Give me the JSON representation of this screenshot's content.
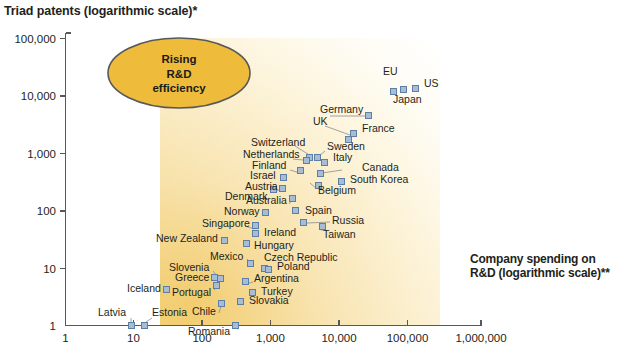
{
  "chart_data": {
    "type": "scatter",
    "title": "",
    "ylabel": "Triad patents (logarithmic scale)*",
    "xlabel": "Company spending on R&D (logarithmic scale)**",
    "xscale": "log",
    "yscale": "log",
    "xlim": [
      1,
      1000000
    ],
    "ylim": [
      1,
      100000
    ],
    "grid": false,
    "legend": "none",
    "x_ticks": [
      "1",
      "10",
      "100",
      "1,000",
      "10,000",
      "100,000",
      "1,000,000"
    ],
    "x_tick_values": [
      1,
      10,
      100,
      1000,
      10000,
      100000,
      1000000
    ],
    "y_ticks": [
      "1",
      "10",
      "100",
      "1,000",
      "10,000",
      "100,000"
    ],
    "y_tick_values": [
      1,
      10,
      100,
      1000,
      10000,
      100000
    ],
    "annotations": [
      {
        "name": "rising-rd-efficiency-callout",
        "lines": [
          "Rising",
          "R&D",
          "efficiency"
        ],
        "shape": "ellipse",
        "fill": "#EFBB3A",
        "stroke": "#58585b"
      }
    ],
    "background_gradient": {
      "description": "pale yellow wedge fading to white toward upper right",
      "from": "#f7d98a",
      "to": "#ffffff"
    },
    "marker_style": {
      "shape": "square",
      "fill": "#a8bdd4",
      "stroke": "#5d7fa6"
    },
    "points": [
      {
        "label": "US",
        "x": 415,
        "y": 88,
        "lx": 424,
        "ly": 83,
        "anchor": "left"
      },
      {
        "label": "EU",
        "x": 403,
        "y": 89,
        "lx": 391,
        "ly": 71,
        "anchor": "left"
      },
      {
        "label": "Japan",
        "x": 393,
        "y": 91,
        "lx": 393,
        "ly": 99,
        "anchor": "left"
      },
      {
        "label": "Germany",
        "x": 368,
        "y": 115,
        "lx": 322,
        "ly": 109,
        "anchor": "left"
      },
      {
        "label": "France",
        "x": 353,
        "y": 133,
        "lx": 362,
        "ly": 128,
        "anchor": "left"
      },
      {
        "label": "UK",
        "x": 348,
        "y": 139,
        "lx": 313,
        "ly": 121,
        "anchor": "left"
      },
      {
        "label": "Switzerland",
        "x": 309,
        "y": 157,
        "lx": 251,
        "ly": 142,
        "anchor": "left"
      },
      {
        "label": "Sweden",
        "x": 317,
        "y": 157,
        "lx": 327,
        "ly": 146,
        "anchor": "left"
      },
      {
        "label": "Netherlands",
        "x": 306,
        "y": 160,
        "lx": 243,
        "ly": 154,
        "anchor": "left"
      },
      {
        "label": "Italy",
        "x": 324,
        "y": 162,
        "lx": 333,
        "ly": 157,
        "anchor": "left"
      },
      {
        "label": "Finland",
        "x": 300,
        "y": 170,
        "lx": 252,
        "ly": 165,
        "anchor": "left"
      },
      {
        "label": "Canada",
        "x": 320,
        "y": 173,
        "lx": 362,
        "ly": 167,
        "anchor": "left"
      },
      {
        "label": "Israel",
        "x": 283,
        "y": 177,
        "lx": 250,
        "ly": 175,
        "anchor": "left"
      },
      {
        "label": "South Korea",
        "x": 341,
        "y": 181,
        "lx": 350,
        "ly": 179,
        "anchor": "left"
      },
      {
        "label": "Austria",
        "x": 282,
        "y": 188,
        "lx": 245,
        "ly": 186,
        "anchor": "left"
      },
      {
        "label": "Belgium",
        "x": 318,
        "y": 185,
        "lx": 318,
        "ly": 190,
        "anchor": "left"
      },
      {
        "label": "Denmark",
        "x": 273,
        "y": 189,
        "lx": 237,
        "ly": 196,
        "anchor": "left"
      },
      {
        "label": "Australia",
        "x": 292,
        "y": 198,
        "lx": 290,
        "ly": 200,
        "anchor": "left"
      },
      {
        "label": "Norway",
        "x": 265,
        "y": 212,
        "lx": 224,
        "ly": 211,
        "anchor": "left"
      },
      {
        "label": "Spain",
        "x": 295,
        "y": 210,
        "lx": 305,
        "ly": 210,
        "anchor": "left"
      },
      {
        "label": "Singapore",
        "x": 255,
        "y": 225,
        "lx": 206,
        "ly": 223,
        "anchor": "left"
      },
      {
        "label": "Russia",
        "x": 303,
        "y": 222,
        "lx": 332,
        "ly": 220,
        "anchor": "left"
      },
      {
        "label": "Ireland",
        "x": 255,
        "y": 233,
        "lx": 264,
        "ly": 232,
        "anchor": "left"
      },
      {
        "label": "Taiwan",
        "x": 322,
        "y": 226,
        "lx": 323,
        "ly": 234,
        "anchor": "left"
      },
      {
        "label": "New Zealand",
        "x": 224,
        "y": 240,
        "lx": 156,
        "ly": 238,
        "anchor": "left"
      },
      {
        "label": "Hungary",
        "x": 246,
        "y": 243,
        "lx": 254,
        "ly": 245,
        "anchor": "left"
      },
      {
        "label": "Mexico",
        "x": 250,
        "y": 263,
        "lx": 210,
        "ly": 256,
        "anchor": "left"
      },
      {
        "label": "Czech Republic",
        "x": 264,
        "y": 268,
        "lx": 264,
        "ly": 257,
        "anchor": "left"
      },
      {
        "label": "Slovenia",
        "x": 214,
        "y": 277,
        "lx": 182,
        "ly": 267,
        "anchor": "left"
      },
      {
        "label": "Poland",
        "x": 268,
        "y": 269,
        "lx": 277,
        "ly": 266,
        "anchor": "left"
      },
      {
        "label": "Greece",
        "x": 220,
        "y": 278,
        "lx": 175,
        "ly": 277,
        "anchor": "left"
      },
      {
        "label": "Argentina",
        "x": 245,
        "y": 281,
        "lx": 254,
        "ly": 278,
        "anchor": "left"
      },
      {
        "label": "Iceland",
        "x": 166,
        "y": 289,
        "lx": 130,
        "ly": 288,
        "anchor": "left"
      },
      {
        "label": "Portugal",
        "x": 216,
        "y": 285,
        "lx": 188,
        "ly": 292,
        "anchor": "left"
      },
      {
        "label": "Turkey",
        "x": 252,
        "y": 292,
        "lx": 261,
        "ly": 291,
        "anchor": "left"
      },
      {
        "label": "Chile",
        "x": 221,
        "y": 303,
        "lx": 206,
        "ly": 311,
        "anchor": "left"
      },
      {
        "label": "Slovakia",
        "x": 240,
        "y": 301,
        "lx": 249,
        "ly": 300,
        "anchor": "left"
      },
      {
        "label": "Latvia",
        "x": 131,
        "y": 325,
        "lx": 110,
        "ly": 312,
        "anchor": "left"
      },
      {
        "label": "Estonia",
        "x": 144,
        "y": 325,
        "lx": 152,
        "ly": 312,
        "anchor": "left"
      },
      {
        "label": "Romania",
        "x": 235,
        "y": 325,
        "lx": 216,
        "ly": 331,
        "anchor": "left"
      }
    ],
    "leader_lines": [
      {
        "from": [
          330,
          116
        ],
        "to": [
          366,
          116
        ]
      },
      {
        "from": [
          325,
          126
        ],
        "to": [
          350,
          135
        ]
      },
      {
        "from": [
          295,
          146
        ],
        "to": [
          311,
          156
        ]
      },
      {
        "from": [
          325,
          151
        ],
        "to": [
          319,
          156
        ]
      },
      {
        "from": [
          293,
          159
        ],
        "to": [
          303,
          160
        ]
      },
      {
        "from": [
          290,
          170
        ],
        "to": [
          300,
          173
        ]
      },
      {
        "from": [
          342,
          170
        ],
        "to": [
          322,
          173
        ]
      },
      {
        "from": [
          281,
          179
        ],
        "to": [
          284,
          178
        ]
      },
      {
        "from": [
          317,
          189
        ],
        "to": [
          310,
          183
        ]
      },
      {
        "from": [
          277,
          191
        ],
        "to": [
          281,
          189
        ]
      },
      {
        "from": [
          289,
          204
        ],
        "to": [
          292,
          200
        ]
      },
      {
        "from": [
          245,
          226
        ],
        "to": [
          254,
          229
        ]
      },
      {
        "from": [
          330,
          222
        ],
        "to": [
          307,
          223
        ]
      },
      {
        "from": [
          322,
          228
        ],
        "to": [
          322,
          231
        ]
      },
      {
        "from": [
          247,
          259
        ],
        "to": [
          252,
          265
        ]
      },
      {
        "from": [
          213,
          271
        ],
        "to": [
          217,
          276
        ]
      },
      {
        "from": [
          253,
          282
        ],
        "to": [
          246,
          284
        ]
      },
      {
        "from": [
          214,
          290
        ],
        "to": [
          218,
          286
        ]
      },
      {
        "from": [
          131,
          318
        ],
        "to": [
          131,
          322
        ]
      },
      {
        "from": [
          152,
          318
        ],
        "to": [
          146,
          322
        ]
      },
      {
        "from": [
          219,
          313
        ],
        "to": [
          221,
          306
        ]
      },
      {
        "from": [
          238,
          329
        ],
        "to": [
          236,
          328
        ]
      }
    ]
  }
}
